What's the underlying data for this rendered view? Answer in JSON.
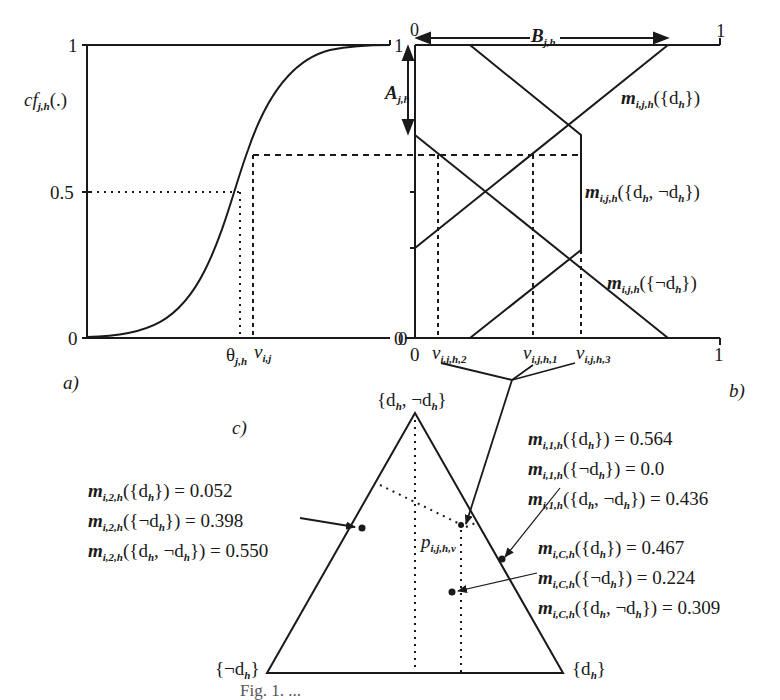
{
  "figure": {
    "caption": "Fig. 1. ...",
    "panel_a": {
      "label": "a)",
      "y_axis_label": "cf",
      "y_axis_label_sub": "j,h",
      "y_axis_label_tail": "(.)",
      "y_ticks": [
        "0",
        "0.5",
        "1"
      ],
      "right_tick_top": "1",
      "right_tick_bottom": "0",
      "x_marker_theta": "θ",
      "x_marker_theta_sub": "j,h",
      "x_marker_v": "v",
      "x_marker_v_sub": "i,j"
    },
    "panel_b": {
      "label": "b)",
      "x_ticks": [
        "0",
        "1"
      ],
      "top_ticks": [
        "0",
        "1"
      ],
      "y_ticks": [
        "0",
        "1"
      ],
      "arrow_A": "A",
      "arrow_A_sub": "j,h",
      "arrow_B": "B",
      "arrow_B_sub": "j,h",
      "curve_d": "m",
      "curve_d_sub": "i,j,h",
      "curve_d_tail": "({d",
      "curve_d_tail_sub": "h",
      "curve_d_end": "})",
      "curve_dnd_tail": "({d",
      "curve_dnd_mid": ", ¬d",
      "curve_nd_tail": "({¬d",
      "v_markers": [
        {
          "v": "v",
          "sub": "i,j,h,2"
        },
        {
          "v": "v",
          "sub": "i,j,h,1"
        },
        {
          "v": "v",
          "sub": "i,j,h,3"
        }
      ]
    },
    "panel_c": {
      "label": "c)",
      "apex_label": "{d",
      "apex_mid": ", ¬d",
      "left_label": "{¬d",
      "right_label": "{d",
      "h_sub": "h",
      "close_brace": "}",
      "point_label": "p",
      "point_label_sub": "i,j,h,v",
      "group_2": [
        {
          "m": "m",
          "sub": "i,2,h",
          "set": "({d",
          "set_sub": "h",
          "tail": "}) = 0.052"
        },
        {
          "m": "m",
          "sub": "i,2,h",
          "set": "({¬d",
          "set_sub": "h",
          "tail": "}) = 0.398"
        },
        {
          "m": "m",
          "sub": "i,2,h",
          "set": "({d",
          "set_sub": "h",
          "mid": ", ¬d",
          "tail": "}) = 0.550"
        }
      ],
      "group_1": [
        {
          "m": "m",
          "sub": "i,1,h",
          "set": "({d",
          "set_sub": "h",
          "tail": "}) = 0.564"
        },
        {
          "m": "m",
          "sub": "i,1,h",
          "set": "({¬d",
          "set_sub": "h",
          "tail": "}) = 0.0"
        },
        {
          "m": "m",
          "sub": "i,1,h",
          "set": "({d",
          "set_sub": "h",
          "mid": ", ¬d",
          "tail": "}) = 0.436"
        }
      ],
      "group_C": [
        {
          "m": "m",
          "sub": "i,C,h",
          "set": "({d",
          "set_sub": "h",
          "tail": "}) = 0.467"
        },
        {
          "m": "m",
          "sub": "i,C,h",
          "set": "({¬d",
          "set_sub": "h",
          "tail": "}) = 0.224"
        },
        {
          "m": "m",
          "sub": "i,C,h",
          "set": "({d",
          "set_sub": "h",
          "mid": ", ¬d",
          "tail": "}) = 0.309"
        }
      ]
    }
  }
}
